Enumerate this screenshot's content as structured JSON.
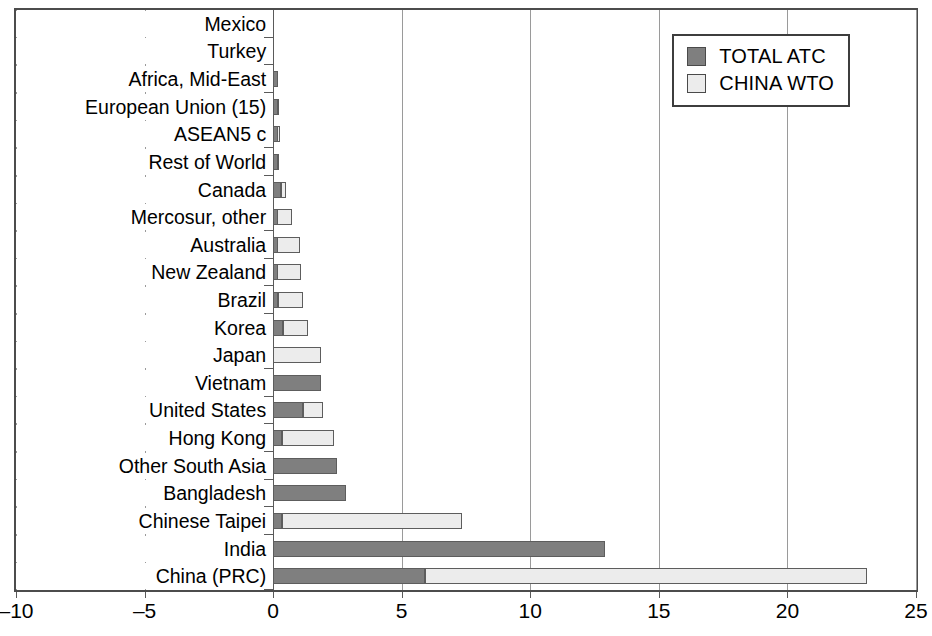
{
  "chart_data": {
    "type": "bar",
    "orientation": "horizontal",
    "stacked": true,
    "title": "",
    "xlabel": "",
    "ylabel": "",
    "xlim": [
      -10,
      25
    ],
    "xticks": [
      -10,
      -5,
      0,
      5,
      10,
      15,
      20,
      25
    ],
    "xtick_labels": [
      "–10",
      "–5",
      "0",
      "5",
      "10",
      "15",
      "20",
      "25"
    ],
    "grid": "vertical",
    "legend_position": "top-right",
    "legend": [
      "TOTAL ATC",
      "CHINA WTO"
    ],
    "colors": {
      "total_atc": "#7f7f7f",
      "china_wto": "#ececec",
      "outline": "#5d5d5d",
      "frame": "#4c4c4c",
      "gridline": "#9a9a9a"
    },
    "categories": [
      "Mexico",
      "Turkey",
      "Africa, Mid-East",
      "European Union (15)",
      "ASEAN5 c",
      "Rest of World",
      "Canada",
      "Mercosur, other",
      "Australia",
      "New Zealand",
      "Brazil",
      "Korea",
      "Japan",
      "Vietnam",
      "United States",
      "Hong Kong",
      "Other South Asia",
      "Bangladesh",
      "Chinese Taipei",
      "India",
      "China (PRC)"
    ],
    "series": [
      {
        "name": "TOTAL ATC",
        "values": [
          -2.0,
          -1.5,
          0.2,
          0.1,
          0.1,
          0.1,
          0.3,
          0.05,
          0.15,
          0.05,
          0.2,
          0.4,
          0.0,
          1.85,
          1.15,
          0.35,
          2.5,
          2.85,
          0.35,
          12.9,
          5.9
        ]
      },
      {
        "name": "CHINA WTO",
        "values": [
          -0.85,
          -2.05,
          0.1,
          0.2,
          0.25,
          0.2,
          0.15,
          0.7,
          0.9,
          1.05,
          0.95,
          0.95,
          1.85,
          -0.35,
          0.8,
          2.0,
          -3.1,
          -2.9,
          7.0,
          -4.0,
          17.2
        ]
      }
    ],
    "segments": [
      {
        "category": "Mexico",
        "total_atc": [
          -2.0,
          0.0
        ],
        "china_wto": [
          -2.85,
          -2.0
        ]
      },
      {
        "category": "Turkey",
        "total_atc": [
          -1.5,
          0.0
        ],
        "china_wto": [
          -3.55,
          -1.5
        ]
      },
      {
        "category": "Africa, Mid-East",
        "total_atc": [
          0.0,
          0.2
        ],
        "china_wto": [
          0.0,
          0.1
        ]
      },
      {
        "category": "European Union (15)",
        "total_atc": [
          0.0,
          0.08
        ],
        "china_wto": [
          0.0,
          0.22
        ]
      },
      {
        "category": "ASEAN5 c",
        "total_atc": [
          0.0,
          0.08
        ],
        "china_wto": [
          0.0,
          0.27
        ]
      },
      {
        "category": "Rest of World",
        "total_atc": [
          0.0,
          0.1
        ],
        "china_wto": [
          0.0,
          0.22
        ]
      },
      {
        "category": "Canada",
        "total_atc": [
          0.0,
          0.3
        ],
        "china_wto": [
          0.3,
          0.45
        ]
      },
      {
        "category": "Mercosur, other",
        "total_atc": [
          0.0,
          0.05
        ],
        "china_wto": [
          0.05,
          0.75
        ]
      },
      {
        "category": "Australia",
        "total_atc": [
          0.0,
          0.15
        ],
        "china_wto": [
          0.15,
          1.05
        ]
      },
      {
        "category": "New Zealand",
        "total_atc": [
          0.0,
          0.05
        ],
        "china_wto": [
          0.05,
          1.1
        ]
      },
      {
        "category": "Brazil",
        "total_atc": [
          0.0,
          0.2
        ],
        "china_wto": [
          0.2,
          1.15
        ]
      },
      {
        "category": "Korea",
        "total_atc": [
          0.0,
          0.4
        ],
        "china_wto": [
          0.4,
          1.35
        ]
      },
      {
        "category": "Japan",
        "total_atc": [
          0.0,
          0.0
        ],
        "china_wto": [
          0.0,
          1.85
        ]
      },
      {
        "category": "Vietnam",
        "total_atc": [
          0.0,
          1.85
        ],
        "china_wto": [
          -0.35,
          0.0
        ]
      },
      {
        "category": "United States",
        "total_atc": [
          0.0,
          1.15
        ],
        "china_wto": [
          1.15,
          1.95
        ]
      },
      {
        "category": "Hong Kong",
        "total_atc": [
          0.0,
          0.35
        ],
        "china_wto": [
          0.35,
          2.35
        ]
      },
      {
        "category": "Other South Asia",
        "total_atc": [
          0.0,
          2.5
        ],
        "china_wto": [
          -3.1,
          0.0
        ]
      },
      {
        "category": "Bangladesh",
        "total_atc": [
          0.0,
          2.85
        ],
        "china_wto": [
          -2.9,
          0.0
        ]
      },
      {
        "category": "Chinese Taipei",
        "total_atc": [
          0.0,
          0.35
        ],
        "china_wto": [
          0.35,
          7.35
        ]
      },
      {
        "category": "India",
        "total_atc": [
          0.0,
          12.9
        ],
        "china_wto": [
          -4.0,
          0.0
        ]
      },
      {
        "category": "China (PRC)",
        "total_atc": [
          0.0,
          5.9
        ],
        "china_wto": [
          5.9,
          23.1
        ]
      }
    ]
  }
}
